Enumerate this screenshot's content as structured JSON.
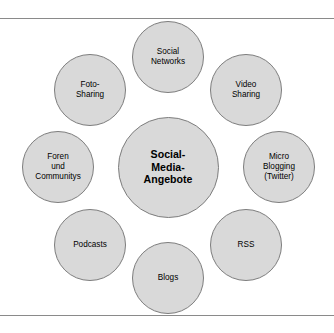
{
  "diagram": {
    "type": "radial-cluster",
    "hub": {
      "label": "Social-\nMedia-\nAngebote",
      "name": "social-media-angebote",
      "cx": 168,
      "cy": 148,
      "r": 50.5
    },
    "satellites": [
      {
        "name": "social-networks",
        "label": "Social\nNetworks",
        "cx": 168,
        "cy": 38,
        "r": 36
      },
      {
        "name": "video-sharing",
        "label": "Video\nSharing",
        "cx": 246,
        "cy": 71,
        "r": 36
      },
      {
        "name": "micro-blogging-twitter",
        "label": "Micro\nBlogging\n(Twitter)",
        "cx": 279,
        "cy": 148,
        "r": 36
      },
      {
        "name": "rss",
        "label": "RSS",
        "cx": 246,
        "cy": 226,
        "r": 36
      },
      {
        "name": "blogs",
        "label": "Blogs",
        "cx": 168,
        "cy": 259,
        "r": 36
      },
      {
        "name": "podcasts",
        "label": "Podcasts",
        "cx": 90,
        "cy": 226,
        "r": 36
      },
      {
        "name": "foren-und-communitys",
        "label": "Foren\nund\nCommunitys",
        "cx": 58,
        "cy": 148,
        "r": 36
      },
      {
        "name": "foto-sharing",
        "label": "Foto-\nSharing",
        "cx": 90,
        "cy": 71,
        "r": 36
      }
    ],
    "colors": {
      "bubble_fill": "#d9d9d9",
      "bubble_stroke": "#7d7d7d",
      "rule": "#8a8a8a",
      "text": "#000000",
      "background": "#ffffff"
    }
  }
}
